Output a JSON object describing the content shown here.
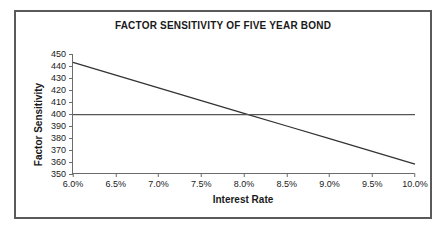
{
  "chart_data": {
    "type": "line",
    "title": "FACTOR SENSITIVITY OF FIVE YEAR BOND",
    "xlabel": "Interest Rate",
    "ylabel": "Factor Sensitivity",
    "xlim": [
      6.0,
      10.0
    ],
    "ylim": [
      350,
      450
    ],
    "grid": false,
    "legend": "none",
    "x_tick_labels": [
      "6.0%",
      "6.5%",
      "7.0%",
      "7.5%",
      "8.0%",
      "8.5%",
      "9.0%",
      "9.5%",
      "10.0%"
    ],
    "x_tick_values": [
      6.0,
      6.5,
      7.0,
      7.5,
      8.0,
      8.5,
      9.0,
      9.5,
      10.0
    ],
    "y_tick_labels": [
      "450",
      "440",
      "430",
      "420",
      "410",
      "400",
      "390",
      "380",
      "370",
      "360",
      "350"
    ],
    "y_tick_values": [
      450,
      440,
      430,
      420,
      410,
      400,
      390,
      380,
      370,
      360,
      350
    ],
    "x": [
      6.0,
      6.5,
      7.0,
      7.5,
      8.0,
      8.5,
      9.0,
      9.5,
      10.0
    ],
    "series": [
      {
        "name": "Factor sensitivity",
        "color": "#333333",
        "values": [
          443.0,
          432.4,
          421.8,
          411.2,
          400.6,
          390.0,
          379.4,
          368.8,
          358.2
        ]
      },
      {
        "name": "Reference level",
        "color": "#555555",
        "values": [
          399.5,
          399.5,
          399.5,
          399.5,
          399.5,
          399.5,
          399.5,
          399.5,
          399.5
        ]
      }
    ]
  },
  "frame": {
    "border_color": "#5a5a5a",
    "background": "#ffffff"
  }
}
